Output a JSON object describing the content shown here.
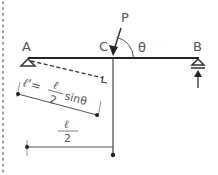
{
  "diagram": {
    "type": "beam-free-body",
    "points": {
      "A": "A",
      "B": "B",
      "C": "C"
    },
    "load": {
      "label": "P",
      "angle_label": "θ"
    },
    "dimensions": {
      "lever_arm_lhs": "ℓ'=",
      "lever_arm_num": "ℓ",
      "lever_arm_den": "2",
      "lever_arm_trig": "sinθ",
      "half_span_num": "ℓ",
      "half_span_den": "2"
    },
    "colors": {
      "beam": "#222222",
      "lines": "#555555",
      "text": "#555555",
      "border_dots": "#777777"
    }
  }
}
